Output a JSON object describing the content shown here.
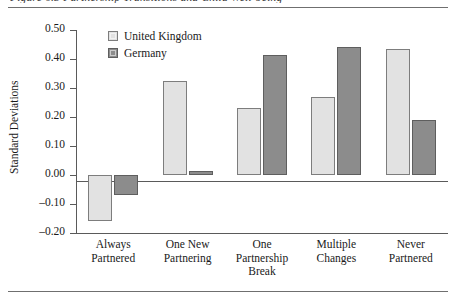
{
  "figure": {
    "caption_sliver": "Figure 6.3   Partnership Transitions and Child Well-being",
    "rules": {
      "top": true,
      "bottom": true
    }
  },
  "legend": {
    "position": "top-left-inside",
    "entries": [
      {
        "label": "United Kingdom",
        "color": "#e2e2e2",
        "icon": "legend-swatch"
      },
      {
        "label": "Germany",
        "color": "#8c8c8c",
        "icon": "legend-swatch"
      }
    ]
  },
  "chart_data": {
    "type": "bar",
    "title": "",
    "xlabel": "",
    "ylabel": "Standard Deviations",
    "ylim": [
      -0.2,
      0.5
    ],
    "ytick_step": 0.1,
    "ytick_labels": [
      "0.50",
      "0.40",
      "0.30",
      "0.20",
      "0.10",
      "0.00",
      "-0.10",
      "-0.20"
    ],
    "ytick_values": [
      0.5,
      0.4,
      0.3,
      0.2,
      0.1,
      0.0,
      -0.1,
      -0.2
    ],
    "grid": false,
    "zero_line": true,
    "categories": [
      "Always\nPartnered",
      "One New\nPartnering",
      "One\nPartnership\nBreak",
      "Multiple\nChanges",
      "Never\nPartnered"
    ],
    "series": [
      {
        "name": "United Kingdom",
        "color": "#e2e2e2",
        "values": [
          -0.16,
          0.325,
          0.23,
          0.27,
          0.435
        ]
      },
      {
        "name": "Germany",
        "color": "#8c8c8c",
        "values": [
          -0.07,
          0.015,
          0.415,
          0.44,
          0.19
        ]
      }
    ]
  }
}
